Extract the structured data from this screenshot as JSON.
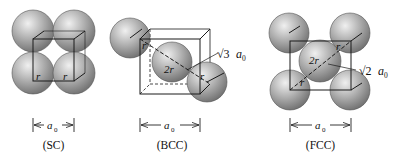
{
  "panels": [
    {
      "id": "sc",
      "caption": "(SC)",
      "dimension_label": "a",
      "dimension_sub": "0",
      "radius_labels": [
        "r",
        "r"
      ]
    },
    {
      "id": "bcc",
      "caption": "(BCC)",
      "dimension_label": "a",
      "dimension_sub": "0",
      "diagonal_label_root": "√3",
      "diagonal_label_var": "a",
      "diagonal_label_sub": "0",
      "radius_labels": [
        "r",
        "2r",
        "r"
      ]
    },
    {
      "id": "fcc",
      "caption": "(FCC)",
      "dimension_label": "a",
      "dimension_sub": "0",
      "diagonal_label_root": "√2",
      "diagonal_label_var": "a",
      "diagonal_label_sub": "0",
      "radius_labels": [
        "r",
        "2r",
        "r"
      ]
    }
  ],
  "colors": {
    "sphere_light": "#e4e4e4",
    "sphere_mid": "#a8a8a8",
    "sphere_dark": "#6e6e6e",
    "line": "#1a1a1a",
    "background": "#ffffff"
  }
}
